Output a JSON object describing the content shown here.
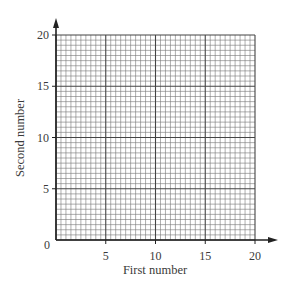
{
  "chart_data": {
    "type": "scatter",
    "title": "",
    "xlabel": "First number",
    "ylabel": "Second number",
    "xlim": [
      0,
      20
    ],
    "ylim": [
      0,
      20
    ],
    "x_ticks": [
      0,
      5,
      10,
      15,
      20
    ],
    "y_ticks": [
      0,
      5,
      10,
      15,
      20
    ],
    "x_tick_labels": [
      "5",
      "10",
      "15",
      "20"
    ],
    "y_tick_labels": [
      "5",
      "10",
      "15",
      "20"
    ],
    "origin_label": "0",
    "grid": true,
    "grid_minor_step": 0.5,
    "grid_major_step": 5,
    "series": [],
    "legend": null
  },
  "colors": {
    "axis": "#222222",
    "major_grid": "#444444",
    "minor_grid": "#777777",
    "text": "#3a3a3a"
  }
}
